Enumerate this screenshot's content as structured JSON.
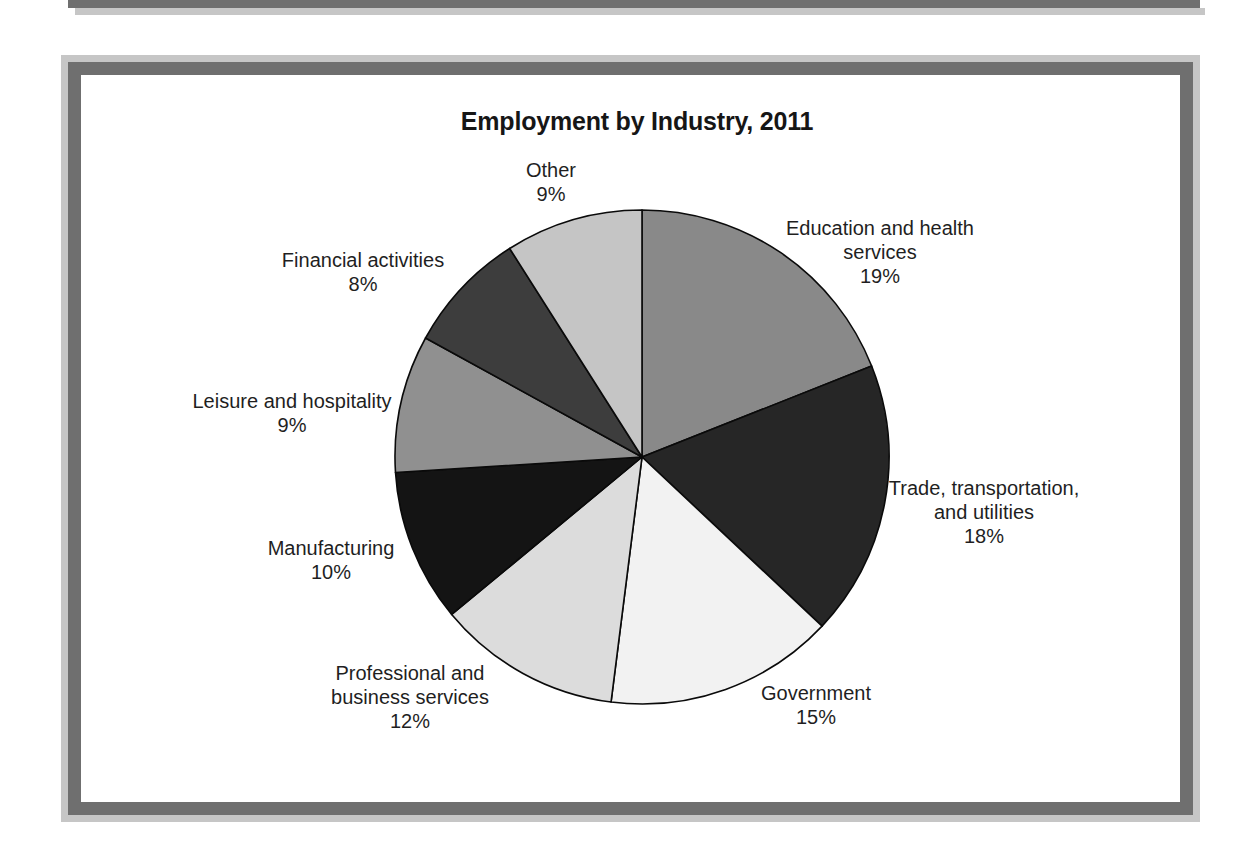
{
  "frame": {
    "outer_color": "#c6c6c6",
    "inner_color": "#6f6f6f"
  },
  "chart_data": {
    "type": "pie",
    "title": "Employment by Industry, 2011",
    "start_angle_deg": 0,
    "direction": "clockwise",
    "total": 100,
    "stroke_color": "#0a0a0a",
    "center": {
      "x": 642,
      "y": 457
    },
    "radius": 247,
    "slices": [
      {
        "label": "Education and health services",
        "label_lines": [
          "Education and health",
          "services"
        ],
        "value": 19,
        "pct_label": "19%",
        "color": "#898989",
        "label_pos": {
          "x": 880,
          "y": 216
        }
      },
      {
        "label": "Trade, transportation, and utilities",
        "label_lines": [
          "Trade, transportation,",
          "and utilities"
        ],
        "value": 18,
        "pct_label": "18%",
        "color": "#262626",
        "label_pos": {
          "x": 984,
          "y": 476
        }
      },
      {
        "label": "Government",
        "label_lines": [
          "Government"
        ],
        "value": 15,
        "pct_label": "15%",
        "color": "#f2f2f2",
        "label_pos": {
          "x": 816,
          "y": 681
        }
      },
      {
        "label": "Professional and business services",
        "label_lines": [
          "Professional and",
          "business services"
        ],
        "value": 12,
        "pct_label": "12%",
        "color": "#dcdcdc",
        "label_pos": {
          "x": 410,
          "y": 661
        }
      },
      {
        "label": "Manufacturing",
        "label_lines": [
          "Manufacturing"
        ],
        "value": 10,
        "pct_label": "10%",
        "color": "#141414",
        "label_pos": {
          "x": 331,
          "y": 536
        }
      },
      {
        "label": "Leisure and hospitality",
        "label_lines": [
          "Leisure and hospitality"
        ],
        "value": 9,
        "pct_label": "9%",
        "color": "#909090",
        "label_pos": {
          "x": 292,
          "y": 389
        }
      },
      {
        "label": "Financial activities",
        "label_lines": [
          "Financial activities"
        ],
        "value": 8,
        "pct_label": "8%",
        "color": "#3d3d3d",
        "label_pos": {
          "x": 363,
          "y": 248
        }
      },
      {
        "label": "Other",
        "label_lines": [
          "Other"
        ],
        "value": 9,
        "pct_label": "9%",
        "color": "#c5c5c5",
        "label_pos": {
          "x": 551,
          "y": 158
        }
      }
    ]
  }
}
